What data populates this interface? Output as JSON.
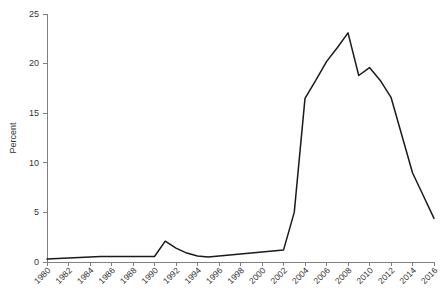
{
  "chart_data": {
    "type": "line",
    "title": "",
    "subtitle": "",
    "xlabel": "",
    "ylabel": "Percent",
    "xlim": [
      1980,
      2016
    ],
    "ylim": [
      0,
      25
    ],
    "y_ticks": [
      0,
      5,
      10,
      15,
      20,
      25
    ],
    "y_tick_labels": [
      "0",
      "5",
      "10",
      "15",
      "20",
      "25"
    ],
    "x_ticks": [
      1980,
      1982,
      1984,
      1986,
      1988,
      1990,
      1992,
      1994,
      1996,
      1998,
      2000,
      2002,
      2004,
      2006,
      2008,
      2010,
      2012,
      2014,
      2016
    ],
    "x_tick_labels": [
      "1980",
      "1982",
      "1984",
      "1986",
      "1988",
      "1990",
      "1992",
      "1994",
      "1996",
      "1998",
      "2000",
      "2002",
      "2004",
      "2006",
      "2008",
      "2010",
      "2012",
      "2014",
      "2016"
    ],
    "grid": false,
    "legend": false,
    "legend_position": "none",
    "line_color": "#1a1a1a",
    "axis_color": "#808080",
    "background_color": "#ffffff",
    "x": [
      1980,
      1981,
      1982,
      1983,
      1984,
      1985,
      1986,
      1987,
      1988,
      1989,
      1990,
      1991,
      1992,
      1993,
      1994,
      1995,
      1996,
      1997,
      1998,
      1999,
      2000,
      2001,
      2002,
      2003,
      2004,
      2005,
      2006,
      2007,
      2008,
      2009,
      2010,
      2011,
      2012,
      2013,
      2014,
      2015,
      2016
    ],
    "values": [
      0.3,
      0.35,
      0.4,
      0.45,
      0.5,
      0.55,
      0.55,
      0.55,
      0.55,
      0.55,
      0.55,
      2.1,
      1.4,
      0.9,
      0.6,
      0.5,
      0.6,
      0.7,
      0.8,
      0.9,
      1.0,
      1.1,
      1.2,
      5.0,
      16.5,
      18.3,
      20.2,
      21.6,
      23.1,
      18.8,
      19.6,
      18.3,
      16.6,
      12.8,
      9.0,
      6.7,
      4.4
    ],
    "series": [
      {
        "name": "Percent",
        "values": [
          0.3,
          0.35,
          0.4,
          0.45,
          0.5,
          0.55,
          0.55,
          0.55,
          0.55,
          0.55,
          0.55,
          2.1,
          1.4,
          0.9,
          0.6,
          0.5,
          0.6,
          0.7,
          0.8,
          0.9,
          1.0,
          1.1,
          1.2,
          5.0,
          16.5,
          18.3,
          20.2,
          21.6,
          23.1,
          18.8,
          19.6,
          18.3,
          16.6,
          12.8,
          9.0,
          6.7,
          4.4
        ]
      }
    ],
    "annotations": []
  }
}
